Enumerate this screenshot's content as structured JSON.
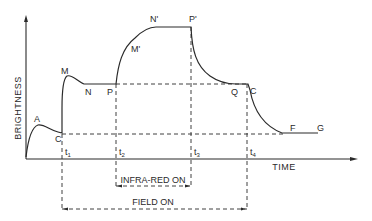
{
  "diagram": {
    "axes": {
      "y_label": "BRIGHTNESS",
      "x_label": "TIME"
    },
    "time_marks": [
      {
        "id": "t1",
        "base": "t",
        "sub": "1"
      },
      {
        "id": "t2",
        "base": "t",
        "sub": "2"
      },
      {
        "id": "t3",
        "base": "t",
        "sub": "3"
      },
      {
        "id": "t4",
        "base": "t",
        "sub": "4"
      }
    ],
    "curve_points": {
      "A": "A",
      "C_start": "C",
      "M": "M",
      "N": "N",
      "P": "P",
      "M_prime": "M'",
      "N_prime": "N'",
      "P_prime": "P'",
      "Q": "Q",
      "C_end": "C",
      "F": "F",
      "G": "G"
    },
    "intervals": {
      "infra_red": "INFRA-RED ON",
      "field": "FIELD ON"
    }
  }
}
